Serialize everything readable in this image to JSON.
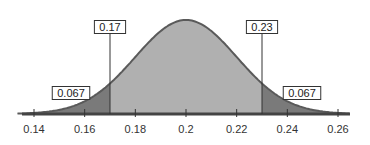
{
  "chart_data": {
    "type": "area",
    "title": "",
    "xlabel": "",
    "ylabel": "",
    "distribution": "normal",
    "mean": 0.2,
    "sd": 0.02,
    "xlim": [
      0.135,
      0.265
    ],
    "x_ticks": [
      0.14,
      0.16,
      0.18,
      0.2,
      0.22,
      0.24,
      0.26
    ],
    "x_tick_labels": [
      "0.14",
      "0.16",
      "0.18",
      "0.2",
      "0.22",
      "0.24",
      "0.26"
    ],
    "cutoffs": [
      {
        "x": 0.17,
        "label": "0.17"
      },
      {
        "x": 0.23,
        "label": "0.23"
      }
    ],
    "regions": [
      {
        "name": "left-tail",
        "from": null,
        "to": 0.17,
        "area": 0.067,
        "label": "0.067",
        "color": "#7a7a7a"
      },
      {
        "name": "middle",
        "from": 0.17,
        "to": 0.23,
        "area": 0.866,
        "label": "",
        "color": "#b0b0b0"
      },
      {
        "name": "right-tail",
        "from": 0.23,
        "to": null,
        "area": 0.067,
        "label": "0.067",
        "color": "#7a7a7a"
      }
    ],
    "grid": false,
    "legend": null
  },
  "colors": {
    "curve": "#5a5a5a",
    "tail_fill": "#7a7a7a",
    "middle_fill": "#b0b0b0",
    "axis": "#444444",
    "label_box_border": "#333333",
    "label_box_fill": "#ffffff"
  }
}
